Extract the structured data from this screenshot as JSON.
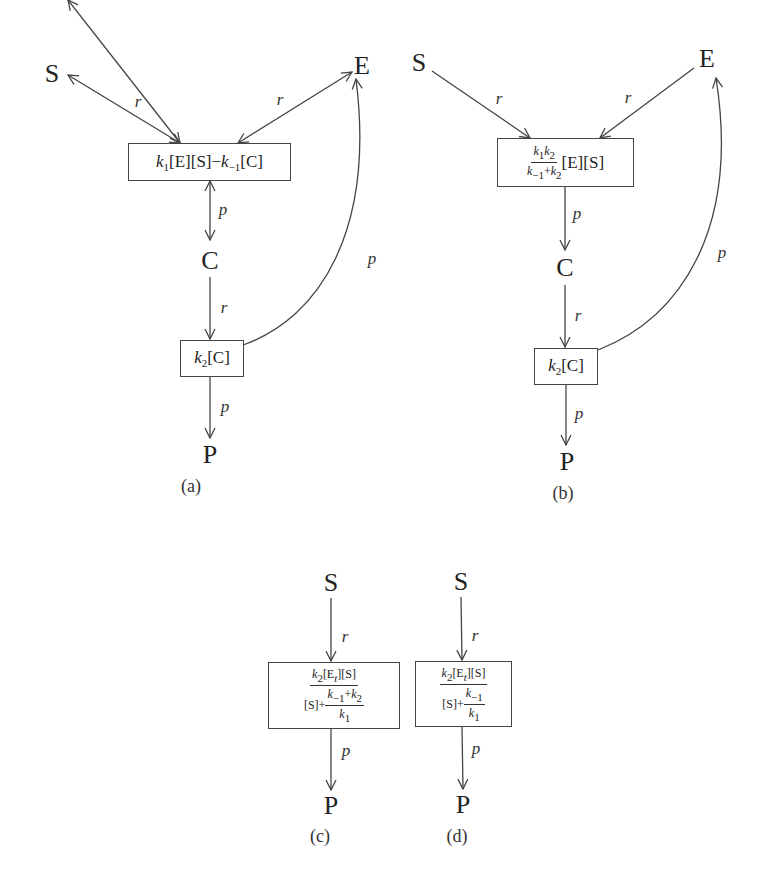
{
  "panels": [
    {
      "id": "a",
      "caption": "(a)",
      "nodes": {
        "S": "S",
        "E": "E",
        "C": "C",
        "P": "P"
      },
      "boxes": [
        {
          "id": "binding",
          "expression": "k1[E][S]−k−1[C]",
          "parts": {
            "k1": "k",
            "k1_sub": "1",
            "mid": "[E][S]−",
            "km1": "k",
            "km1_sub": "−1",
            "tail": "[C]"
          }
        },
        {
          "id": "catalysis",
          "expression": "k2[C]",
          "parts": {
            "k": "k",
            "sub": "2",
            "tail": "[C]"
          }
        }
      ],
      "edges": [
        {
          "from": "S",
          "to": "binding",
          "label": "r",
          "bidirectional": true
        },
        {
          "from": "E",
          "to": "binding",
          "label": "r",
          "bidirectional": true
        },
        {
          "from": "binding",
          "to": "C",
          "label": "p",
          "bidirectional": true
        },
        {
          "from": "C",
          "to": "catalysis",
          "label": "r"
        },
        {
          "from": "catalysis",
          "to": "P",
          "label": "p"
        },
        {
          "from": "catalysis",
          "to": "E",
          "label": "p",
          "curved": true
        }
      ]
    },
    {
      "id": "b",
      "caption": "(b)",
      "nodes": {
        "S": "S",
        "E": "E",
        "C": "C",
        "P": "P"
      },
      "boxes": [
        {
          "id": "binding",
          "expression": "k1k2/(k−1+k2) [E][S]",
          "parts": {
            "num_k1": "k",
            "num_k1_sub": "1",
            "num_k2": "k",
            "num_k2_sub": "2",
            "den_km1": "k",
            "den_km1_sub": "−1",
            "den_plus": "+",
            "den_k2": "k",
            "den_k2_sub": "2",
            "tail": "[E][S]"
          }
        },
        {
          "id": "catalysis",
          "expression": "k2[C]",
          "parts": {
            "k": "k",
            "sub": "2",
            "tail": "[C]"
          }
        }
      ],
      "edges": [
        {
          "from": "S",
          "to": "binding",
          "label": "r"
        },
        {
          "from": "E",
          "to": "binding",
          "label": "r"
        },
        {
          "from": "binding",
          "to": "C",
          "label": "p"
        },
        {
          "from": "C",
          "to": "catalysis",
          "label": "r"
        },
        {
          "from": "catalysis",
          "to": "P",
          "label": "p"
        },
        {
          "from": "catalysis",
          "to": "E",
          "label": "p",
          "curved": true
        }
      ]
    },
    {
      "id": "c",
      "caption": "(c)",
      "nodes": {
        "S": "S",
        "P": "P"
      },
      "boxes": [
        {
          "id": "rate",
          "expression": "k2[Et][S] / ([S] + (k−1+k2)/k1)",
          "parts": {
            "num_k": "k",
            "num_k_sub": "2",
            "num_E": "[E",
            "num_E_sub": "t",
            "num_tail": "][S]",
            "den_S": "[S]+",
            "inner_num_k": "k",
            "inner_num_k_sub": "−1",
            "inner_plus": "+",
            "inner_num_k2": "k",
            "inner_num_k2_sub": "2",
            "inner_den_k": "k",
            "inner_den_k_sub": "1"
          }
        }
      ],
      "edges": [
        {
          "from": "S",
          "to": "rate",
          "label": "r"
        },
        {
          "from": "rate",
          "to": "P",
          "label": "p"
        }
      ]
    },
    {
      "id": "d",
      "caption": "(d)",
      "nodes": {
        "S": "S",
        "P": "P"
      },
      "boxes": [
        {
          "id": "rate",
          "expression": "k2[Et][S] / ([S] + k−1/k1)",
          "parts": {
            "num_k": "k",
            "num_k_sub": "2",
            "num_E": "[E",
            "num_E_sub": "t",
            "num_tail": "][S]",
            "den_S": "[S]+",
            "inner_num_k": "k",
            "inner_num_k_sub": "−1",
            "inner_den_k": "k",
            "inner_den_k_sub": "1"
          }
        }
      ],
      "edges": [
        {
          "from": "S",
          "to": "rate",
          "label": "r"
        },
        {
          "from": "rate",
          "to": "P",
          "label": "p"
        }
      ]
    }
  ],
  "colors": {
    "line": "#444444",
    "text": "#222222",
    "background": "#ffffff"
  }
}
